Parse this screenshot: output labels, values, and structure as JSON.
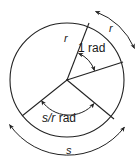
{
  "figure": {
    "background_color": "#ffffff",
    "stroke_color": "#222222",
    "text_color": "#1a1a1a",
    "circle": {
      "center_x": 67,
      "center_y": 80,
      "radius": 57
    },
    "labels": {
      "radius_r": "r",
      "angle_one_rad": "1 rad",
      "angle_s_over_r_rad_italic": "s/r",
      "angle_s_over_r_rad_unit": " rad",
      "outer_arc_r": "r",
      "outer_arc_s": "s"
    },
    "radii": [
      {
        "name": "radius-up-right",
        "end_x": 89,
        "end_y": 23
      },
      {
        "name": "radius-right",
        "end_x": 123,
        "end_y": 62
      },
      {
        "name": "radius-down-left",
        "end_x": 22,
        "end_y": 116
      },
      {
        "name": "radius-down-right",
        "end_x": 114,
        "end_y": 119
      }
    ],
    "inner_arcs": [
      {
        "name": "arc-one-rad",
        "arrows": "both"
      },
      {
        "name": "arc-s-over-r-rad",
        "arrows": "both"
      }
    ],
    "outer_arcs": [
      {
        "name": "outer-arc-r",
        "label": "r",
        "arrows": "both"
      },
      {
        "name": "outer-arc-s",
        "label": "s",
        "arrows": "both"
      }
    ]
  }
}
